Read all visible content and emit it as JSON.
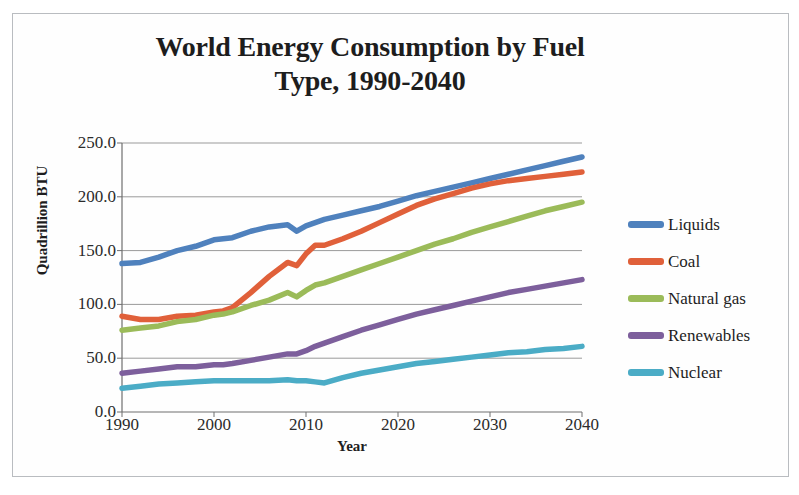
{
  "chart_data": {
    "type": "line",
    "title": "World Energy Consumption by Fuel Type, 1990-2040",
    "title_line1": "World Energy Consumption by Fuel",
    "title_line2": "Type, 1990-2040",
    "xlabel": "Year",
    "ylabel": "Quadrillion BTU",
    "xlim": [
      1990,
      2040
    ],
    "ylim": [
      0,
      250
    ],
    "grid": true,
    "legend_position": "right",
    "y_ticks": [
      0,
      50,
      100,
      150,
      200,
      250
    ],
    "y_tick_labels": [
      "0.0",
      "50.0",
      "100.0",
      "150.0",
      "200.0",
      "250.0"
    ],
    "x_ticks": [
      1990,
      2000,
      2010,
      2020,
      2030,
      2040
    ],
    "x_tick_labels": [
      "1990",
      "2000",
      "2010",
      "2020",
      "2030",
      "2040"
    ],
    "x": [
      1990,
      1992,
      1994,
      1996,
      1998,
      2000,
      2001,
      2002,
      2004,
      2006,
      2008,
      2009,
      2010,
      2011,
      2012,
      2014,
      2016,
      2018,
      2020,
      2022,
      2024,
      2026,
      2028,
      2030,
      2032,
      2034,
      2036,
      2038,
      2040
    ],
    "series": [
      {
        "name": "Liquids",
        "color": "#4f81bd",
        "values": [
          138,
          139,
          144,
          150,
          154,
          160,
          161,
          162,
          168,
          172,
          174,
          168,
          173,
          176,
          179,
          183,
          187,
          191,
          196,
          201,
          205,
          209,
          213,
          217,
          221,
          225,
          229,
          233,
          237
        ]
      },
      {
        "name": "Coal",
        "color": "#e0603a",
        "values": [
          89,
          86,
          86,
          89,
          90,
          93,
          94,
          97,
          111,
          126,
          139,
          136,
          147,
          155,
          155,
          161,
          168,
          176,
          184,
          192,
          198,
          203,
          208,
          212,
          215,
          217,
          219,
          221,
          223
        ]
      },
      {
        "name": "Natural gas",
        "color": "#9bbb59",
        "values": [
          76,
          78,
          80,
          84,
          86,
          90,
          91,
          93,
          99,
          104,
          111,
          107,
          113,
          118,
          120,
          126,
          132,
          138,
          144,
          150,
          156,
          161,
          167,
          172,
          177,
          182,
          187,
          191,
          195
        ]
      },
      {
        "name": "Renewables",
        "color": "#7d5f9c",
        "values": [
          36,
          38,
          40,
          42,
          42,
          44,
          44,
          45,
          48,
          51,
          54,
          54,
          57,
          61,
          64,
          70,
          76,
          81,
          86,
          91,
          95,
          99,
          103,
          107,
          111,
          114,
          117,
          120,
          123
        ]
      },
      {
        "name": "Nuclear",
        "color": "#4bacc6",
        "values": [
          22,
          24,
          26,
          27,
          28,
          29,
          29,
          29,
          29,
          29,
          30,
          29,
          29,
          28,
          27,
          32,
          36,
          39,
          42,
          45,
          47,
          49,
          51,
          53,
          55,
          56,
          58,
          59,
          61
        ]
      }
    ]
  },
  "colors": {
    "liquids": "#4f81bd",
    "coal": "#e0603a",
    "natural_gas": "#9bbb59",
    "renewables": "#7d5f9c",
    "nuclear": "#4bacc6",
    "gridline": "#9a9a9a",
    "axis": "#6e6e6e",
    "text": "#1d1d1d",
    "page_border": "#b9bcc0"
  }
}
